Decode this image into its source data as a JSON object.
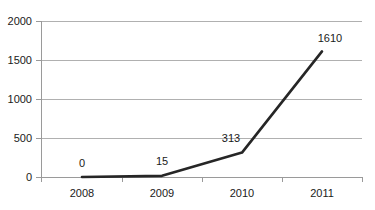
{
  "chart_data": {
    "type": "line",
    "title": "",
    "subtitle": "",
    "xlabel": "",
    "ylabel": "",
    "categories": [
      "2008",
      "2009",
      "2010",
      "2011"
    ],
    "values": [
      0,
      15,
      313,
      1610
    ],
    "point_labels": [
      "0",
      "15",
      "313",
      "1610"
    ],
    "series": [
      {
        "name": "",
        "values": [
          0,
          15,
          313,
          1610
        ]
      }
    ],
    "ylim": [
      0,
      2000
    ],
    "yticks": [
      0,
      500,
      1000,
      1500,
      2000
    ],
    "ytick_labels": [
      "0",
      "500",
      "1000",
      "1500",
      "2000"
    ],
    "grid": true,
    "legend": false,
    "legend_position": "none",
    "line_color": "#262626",
    "grid_color": "#b0b0b0",
    "axis_color": "#9a9a9a",
    "background_color": "#ffffff",
    "text_color": "#1a1a1a"
  }
}
